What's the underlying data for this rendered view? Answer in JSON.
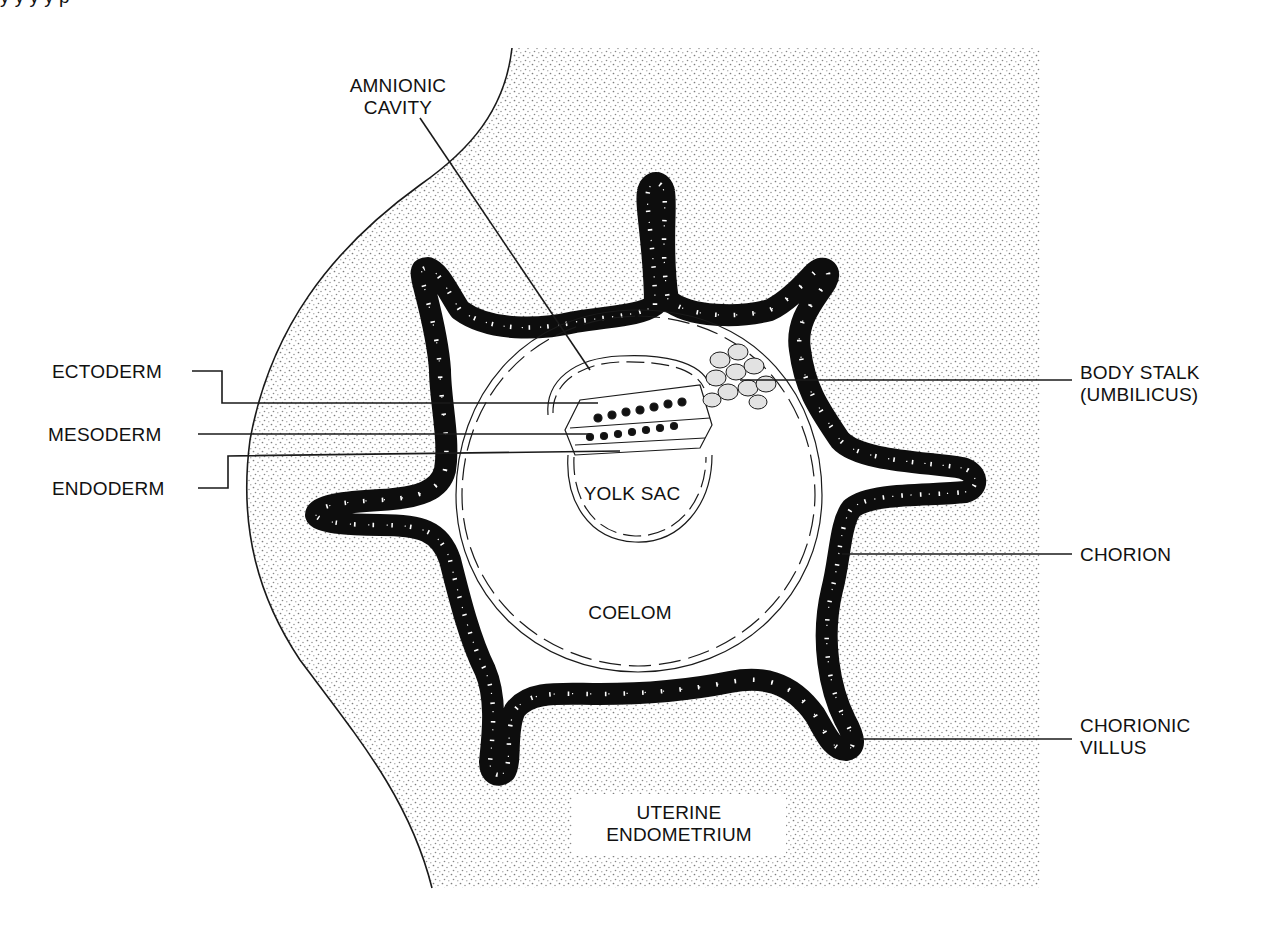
{
  "figure": {
    "type": "embryology-diagram",
    "colors": {
      "ink": "#111111",
      "stipple": "#8a8a8a",
      "background": "#ffffff",
      "chorion_fill": "#0d0d0d",
      "nucleus": "#ffffff",
      "disc_cell_fill": "#ffffff",
      "stalk_cell_fill": "#e2e2e2"
    }
  },
  "header_fragment": {
    "text": "y y    y         y        p"
  },
  "labels": {
    "amnionic_cavity": [
      "AMNIONIC",
      "CAVITY"
    ],
    "ectoderm": "ECTODERM",
    "mesoderm": "MESODERM",
    "endoderm": "ENDODERM",
    "body_stalk": [
      "BODY STALK",
      "(UMBILICUS)"
    ],
    "yolk_sac": "YOLK SAC",
    "chorion": "CHORION",
    "coelom": "COELOM",
    "chorionic_villus": [
      "CHORIONIC",
      "VILLUS"
    ],
    "uterine_endometrium": [
      "UTERINE",
      "ENDOMETRIUM"
    ]
  },
  "structures": [
    {
      "id": "uterine-endometrium",
      "name": "Uterine endometrium",
      "style": "stippled"
    },
    {
      "id": "chorion",
      "name": "Chorion",
      "style": "black cell band with white nuclei",
      "villus_count": 7
    },
    {
      "id": "coelom",
      "name": "Coelom",
      "style": "open cavity"
    },
    {
      "id": "amnionic-cavity",
      "name": "Amnionic cavity",
      "style": "spindle-cell membrane"
    },
    {
      "id": "yolk-sac",
      "name": "Yolk sac",
      "style": "spindle-cell membrane"
    },
    {
      "id": "embryonic-disc",
      "name": "Trilaminar embryonic disc",
      "layers": [
        "Ectoderm",
        "Mesoderm",
        "Endoderm"
      ]
    },
    {
      "id": "body-stalk",
      "name": "Body stalk (umbilicus)",
      "style": "cluster of rounded cells"
    }
  ]
}
